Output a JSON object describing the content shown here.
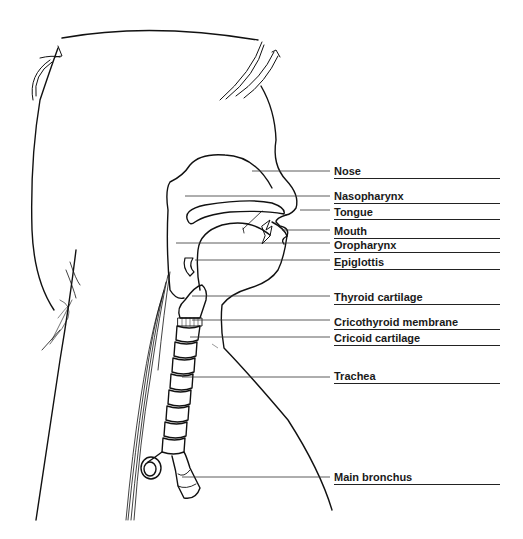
{
  "figure": {
    "stroke_color": "#111111",
    "leader_color": "#333333"
  },
  "labels": [
    {
      "id": "nose",
      "text": "Nose",
      "x": 334,
      "y": 165,
      "line_start_x": 252,
      "line_y": 171
    },
    {
      "id": "nasopharynx",
      "text": "Nasopharynx",
      "x": 334,
      "y": 190,
      "line_start_x": 185,
      "line_y": 196
    },
    {
      "id": "tongue",
      "text": "Tongue",
      "x": 334,
      "y": 206,
      "line_start_x": 300,
      "line_y": 210
    },
    {
      "id": "mouth",
      "text": "Mouth",
      "x": 334,
      "y": 225,
      "line_start_x": 282,
      "line_y": 230
    },
    {
      "id": "oropharynx",
      "text": "Oropharynx",
      "x": 334,
      "y": 239,
      "line_start_x": 176,
      "line_y": 243
    },
    {
      "id": "epiglottis",
      "text": "Epiglottis",
      "x": 334,
      "y": 256,
      "line_start_x": 195,
      "line_y": 260
    },
    {
      "id": "thyroid-cartilage",
      "text": "Thyroid cartilage",
      "x": 334,
      "y": 291,
      "line_start_x": 192,
      "line_y": 296
    },
    {
      "id": "cricothyroid-membrane",
      "text": "Cricothyroid membrane",
      "x": 334,
      "y": 316,
      "line_start_x": 192,
      "line_y": 320
    },
    {
      "id": "cricoid-cartilage",
      "text": "Cricoid cartilage",
      "x": 334,
      "y": 332,
      "line_start_x": 190,
      "line_y": 337
    },
    {
      "id": "trachea",
      "text": "Trachea",
      "x": 334,
      "y": 370,
      "line_start_x": 182,
      "line_y": 377
    },
    {
      "id": "main-bronchus",
      "text": "Main bronchus",
      "x": 334,
      "y": 471,
      "line_start_x": 182,
      "line_y": 477
    }
  ],
  "underline_end_x": 500,
  "signature": "signature"
}
